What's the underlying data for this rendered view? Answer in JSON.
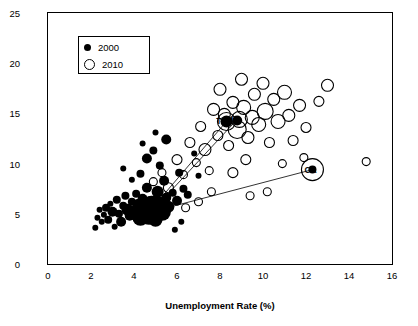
{
  "chart_data": {
    "type": "scatter",
    "title": "",
    "xlabel": "Unemployment Rate (%)",
    "ylabel": "SNAP Participation as % of Total Population",
    "xlim": [
      0,
      16
    ],
    "ylim": [
      0,
      25
    ],
    "xticks": [
      0,
      2,
      4,
      6,
      8,
      10,
      12,
      14,
      16
    ],
    "yticks": [
      0,
      5,
      10,
      15,
      20,
      25
    ],
    "grid": false,
    "legend": {
      "position": "top-left-inside",
      "entries": [
        {
          "label": "2000",
          "marker": "filled-circle"
        },
        {
          "label": "2010",
          "marker": "open-circle"
        }
      ]
    },
    "annotations": [
      {
        "text": "TX",
        "x": 8.2,
        "y": 14.2
      },
      {
        "text": "NY",
        "x": 8.7,
        "y": 14.4
      },
      {
        "text": "CA",
        "x": 12.3,
        "y": 9.4
      }
    ],
    "series": [
      {
        "name": "2000",
        "marker": "filled-circle",
        "points": [
          {
            "x": 2.3,
            "y": 4.6,
            "r": 3
          },
          {
            "x": 2.5,
            "y": 4.2,
            "r": 3
          },
          {
            "x": 2.6,
            "y": 4.9,
            "r": 3
          },
          {
            "x": 2.7,
            "y": 5.6,
            "r": 4
          },
          {
            "x": 2.8,
            "y": 4.4,
            "r": 4
          },
          {
            "x": 2.9,
            "y": 6.0,
            "r": 3
          },
          {
            "x": 3.0,
            "y": 5.2,
            "r": 5
          },
          {
            "x": 3.1,
            "y": 3.7,
            "r": 3
          },
          {
            "x": 3.2,
            "y": 6.4,
            "r": 4
          },
          {
            "x": 3.3,
            "y": 5.0,
            "r": 4
          },
          {
            "x": 3.4,
            "y": 4.2,
            "r": 5
          },
          {
            "x": 3.5,
            "y": 5.8,
            "r": 4
          },
          {
            "x": 3.6,
            "y": 6.8,
            "r": 4
          },
          {
            "x": 3.7,
            "y": 5.4,
            "r": 6
          },
          {
            "x": 3.8,
            "y": 4.8,
            "r": 5
          },
          {
            "x": 3.9,
            "y": 6.2,
            "r": 4
          },
          {
            "x": 4.0,
            "y": 5.1,
            "r": 7
          },
          {
            "x": 4.1,
            "y": 7.0,
            "r": 4
          },
          {
            "x": 4.2,
            "y": 5.9,
            "r": 6
          },
          {
            "x": 4.3,
            "y": 4.6,
            "r": 8
          },
          {
            "x": 4.4,
            "y": 6.5,
            "r": 5
          },
          {
            "x": 4.5,
            "y": 5.3,
            "r": 9
          },
          {
            "x": 4.6,
            "y": 7.6,
            "r": 5
          },
          {
            "x": 4.7,
            "y": 5.0,
            "r": 11
          },
          {
            "x": 4.8,
            "y": 6.0,
            "r": 8
          },
          {
            "x": 4.9,
            "y": 5.5,
            "r": 13
          },
          {
            "x": 5.0,
            "y": 4.4,
            "r": 7
          },
          {
            "x": 5.1,
            "y": 7.2,
            "r": 6
          },
          {
            "x": 5.2,
            "y": 6.1,
            "r": 6
          },
          {
            "x": 5.3,
            "y": 5.2,
            "r": 9
          },
          {
            "x": 5.4,
            "y": 8.3,
            "r": 5
          },
          {
            "x": 5.5,
            "y": 6.6,
            "r": 5
          },
          {
            "x": 5.6,
            "y": 5.7,
            "r": 6
          },
          {
            "x": 5.8,
            "y": 7.1,
            "r": 4
          },
          {
            "x": 6.0,
            "y": 6.3,
            "r": 5
          },
          {
            "x": 6.1,
            "y": 9.1,
            "r": 4
          },
          {
            "x": 6.3,
            "y": 7.5,
            "r": 4
          },
          {
            "x": 6.5,
            "y": 6.9,
            "r": 4
          },
          {
            "x": 4.3,
            "y": 9.0,
            "r": 4
          },
          {
            "x": 4.6,
            "y": 10.5,
            "r": 5
          },
          {
            "x": 4.9,
            "y": 11.3,
            "r": 4
          },
          {
            "x": 5.2,
            "y": 9.8,
            "r": 4
          },
          {
            "x": 5.5,
            "y": 12.4,
            "r": 5
          },
          {
            "x": 5.0,
            "y": 13.1,
            "r": 3
          },
          {
            "x": 4.4,
            "y": 12.0,
            "r": 3
          },
          {
            "x": 3.9,
            "y": 8.4,
            "r": 3
          },
          {
            "x": 3.5,
            "y": 9.5,
            "r": 3
          },
          {
            "x": 6.8,
            "y": 11.0,
            "r": 3
          },
          {
            "x": 7.0,
            "y": 8.8,
            "r": 3
          },
          {
            "x": 8.3,
            "y": 14.2,
            "r": 6
          },
          {
            "x": 8.8,
            "y": 14.3,
            "r": 5
          },
          {
            "x": 12.3,
            "y": 9.4,
            "r": 4
          },
          {
            "x": 2.2,
            "y": 3.6,
            "r": 3
          },
          {
            "x": 2.4,
            "y": 5.4,
            "r": 3
          },
          {
            "x": 6.2,
            "y": 4.2,
            "r": 3
          },
          {
            "x": 5.9,
            "y": 3.4,
            "r": 3
          }
        ]
      },
      {
        "name": "2010",
        "marker": "open-circle",
        "points": [
          {
            "x": 4.9,
            "y": 8.2,
            "r": 4
          },
          {
            "x": 5.3,
            "y": 9.1,
            "r": 4
          },
          {
            "x": 5.6,
            "y": 7.6,
            "r": 5
          },
          {
            "x": 6.0,
            "y": 10.4,
            "r": 5
          },
          {
            "x": 6.3,
            "y": 8.9,
            "r": 4
          },
          {
            "x": 6.6,
            "y": 12.1,
            "r": 5
          },
          {
            "x": 6.9,
            "y": 10.1,
            "r": 4
          },
          {
            "x": 7.1,
            "y": 13.7,
            "r": 5
          },
          {
            "x": 7.3,
            "y": 11.4,
            "r": 6
          },
          {
            "x": 7.5,
            "y": 9.3,
            "r": 4
          },
          {
            "x": 7.7,
            "y": 15.4,
            "r": 6
          },
          {
            "x": 7.9,
            "y": 12.8,
            "r": 5
          },
          {
            "x": 8.0,
            "y": 17.4,
            "r": 6
          },
          {
            "x": 8.2,
            "y": 14.9,
            "r": 6
          },
          {
            "x": 8.4,
            "y": 11.8,
            "r": 5
          },
          {
            "x": 8.6,
            "y": 16.1,
            "r": 6
          },
          {
            "x": 8.8,
            "y": 13.4,
            "r": 9
          },
          {
            "x": 9.0,
            "y": 18.4,
            "r": 6
          },
          {
            "x": 9.1,
            "y": 15.6,
            "r": 7
          },
          {
            "x": 9.3,
            "y": 12.6,
            "r": 6
          },
          {
            "x": 9.5,
            "y": 14.6,
            "r": 7
          },
          {
            "x": 9.6,
            "y": 16.9,
            "r": 6
          },
          {
            "x": 9.8,
            "y": 13.9,
            "r": 7
          },
          {
            "x": 10.0,
            "y": 18.0,
            "r": 6
          },
          {
            "x": 10.1,
            "y": 15.2,
            "r": 8
          },
          {
            "x": 10.3,
            "y": 12.1,
            "r": 5
          },
          {
            "x": 10.5,
            "y": 16.4,
            "r": 6
          },
          {
            "x": 10.7,
            "y": 14.2,
            "r": 7
          },
          {
            "x": 11.0,
            "y": 17.1,
            "r": 7
          },
          {
            "x": 11.2,
            "y": 14.8,
            "r": 6
          },
          {
            "x": 11.4,
            "y": 12.3,
            "r": 5
          },
          {
            "x": 11.7,
            "y": 15.8,
            "r": 6
          },
          {
            "x": 12.0,
            "y": 13.6,
            "r": 5
          },
          {
            "x": 12.3,
            "y": 9.4,
            "r": 11
          },
          {
            "x": 12.6,
            "y": 16.2,
            "r": 5
          },
          {
            "x": 13.0,
            "y": 17.8,
            "r": 6
          },
          {
            "x": 14.8,
            "y": 10.2,
            "r": 4
          },
          {
            "x": 8.3,
            "y": 14.2,
            "r": 9
          },
          {
            "x": 8.9,
            "y": 14.4,
            "r": 8
          },
          {
            "x": 9.2,
            "y": 10.4,
            "r": 5
          },
          {
            "x": 8.6,
            "y": 9.1,
            "r": 5
          },
          {
            "x": 7.6,
            "y": 7.2,
            "r": 4
          },
          {
            "x": 9.4,
            "y": 6.8,
            "r": 4
          },
          {
            "x": 10.2,
            "y": 7.2,
            "r": 4
          },
          {
            "x": 7.0,
            "y": 6.2,
            "r": 4
          },
          {
            "x": 6.4,
            "y": 5.6,
            "r": 4
          },
          {
            "x": 5.1,
            "y": 6.0,
            "r": 4
          },
          {
            "x": 11.9,
            "y": 10.6,
            "r": 4
          },
          {
            "x": 10.9,
            "y": 10.0,
            "r": 4
          }
        ]
      }
    ],
    "connectors": [
      {
        "label": "TX",
        "from": {
          "x": 4.7,
          "y": 5.2
        },
        "to": {
          "x": 8.3,
          "y": 14.2
        }
      },
      {
        "label": "NY",
        "from": {
          "x": 4.9,
          "y": 5.4
        },
        "to": {
          "x": 8.8,
          "y": 14.4
        }
      },
      {
        "label": "CA",
        "from": {
          "x": 5.0,
          "y": 5.3
        },
        "to": {
          "x": 12.3,
          "y": 9.4
        }
      }
    ]
  },
  "axes": {
    "xlabel": "Unemployment Rate (%)",
    "ylabel": "SNAP Participation as % of Total Population",
    "xticks": [
      "0",
      "2",
      "4",
      "6",
      "8",
      "10",
      "12",
      "14",
      "16"
    ],
    "yticks": [
      "0",
      "5",
      "10",
      "15",
      "20",
      "25"
    ]
  },
  "legend": {
    "entry_2000": "2000",
    "entry_2010": "2010"
  },
  "annotations": {
    "tx": "TX",
    "ny": "NY",
    "ca": "CA"
  }
}
